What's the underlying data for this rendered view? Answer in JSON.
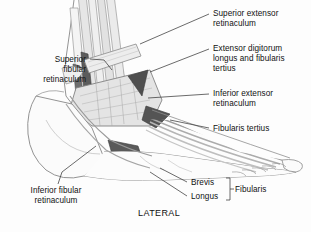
{
  "figure": {
    "orientation_label": "LATERAL",
    "background_color": "#fdfdfd",
    "ink_color": "#555555",
    "tendon_dark_color": "#4a4a4a",
    "tendon_mid_color": "#8d8d8d",
    "tendon_light_color": "#d8d8d8",
    "bone_fill_color": "#f2f2f2"
  },
  "labels": {
    "superior_extensor_retinaculum": "Superior extensor\nretinaculum",
    "extensor_digitorum_longus_and_fibularis_tertius": "Extensor digitorum\nlongus and fibularis\ntertius",
    "inferior_extensor_retinaculum": "Inferior extensor\nretinaculum",
    "fibularis_tertius": "Fibularis tertius",
    "superior_fibular_retinaculum": "Superior\nfibular\nretinaculum",
    "inferior_fibular_retinaculum": "Inferior fibular\nretinaculum",
    "brevis": "Brevis",
    "longus": "Longus",
    "fibularis_group": "Fibularis",
    "lateral": "LATERAL"
  }
}
